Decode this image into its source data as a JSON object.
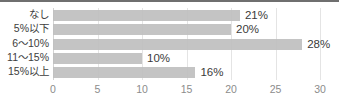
{
  "chart_data": {
    "type": "bar",
    "orientation": "horizontal",
    "title": "",
    "subtitle": "",
    "xlabel": "",
    "ylabel": "",
    "categories": [
      "なし",
      "5%以下",
      "6〜10%",
      "11〜15%",
      "15%以上"
    ],
    "values": [
      21,
      20,
      28,
      10,
      16
    ],
    "data_labels": [
      "21%",
      "20%",
      "28%",
      "10%",
      "16%"
    ],
    "xlim": [
      0,
      30
    ],
    "xticks": [
      0,
      5,
      10,
      15,
      20,
      25,
      30
    ],
    "xtick_labels": [
      "0",
      "5",
      "10",
      "15",
      "20",
      "25",
      "30"
    ],
    "grid": "vertical",
    "legend": "none",
    "bar_color": "#bfbfbf",
    "gridline_color": "#e4e4e4",
    "label_text_color": "#3d3d3d",
    "tick_text_color": "#8c8c8c",
    "background_color": "#ffffff",
    "border_top_color": "#6f6f6f"
  }
}
